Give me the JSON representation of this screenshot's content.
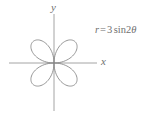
{
  "figure": {
    "caption_equation": "r = 3 sin 2θ",
    "axis_labels": {
      "x": "x",
      "y": "y"
    },
    "equation_parts": {
      "variable": "r",
      "equals": "=",
      "coefficient": "3",
      "function": "sin",
      "multiplier": "2",
      "angle": "θ"
    },
    "colors": {
      "curve": "#8a8a8a",
      "axis": "#9a9a9a",
      "text": "#6f6f6f",
      "background": "#ffffff"
    }
  },
  "chart_data": {
    "type": "line",
    "title": "",
    "subtitle": "",
    "xlabel": "x",
    "ylabel": "y",
    "annotations": [
      "r = 3 sin 2θ"
    ],
    "grid": false,
    "legend": "none",
    "coordinate_system": "polar",
    "curve_name": "four-petaled rose",
    "polar_equation": "r = 3 sin(2θ)",
    "amplitude": 3,
    "petal_count": 4,
    "petal_max_radius": 3,
    "petal_axis_angles_deg": [
      45,
      135,
      225,
      315
    ],
    "theta_range_deg": [
      0,
      360
    ],
    "xlim": [
      -3.2,
      3.2
    ],
    "ylim": [
      -3.2,
      3.2
    ],
    "origin": {
      "x": 0,
      "y": 0
    },
    "series": [
      {
        "name": "r = 3 sin 2θ",
        "theta_deg": [
          0,
          10,
          20,
          30,
          40,
          45,
          50,
          60,
          70,
          80,
          90,
          100,
          110,
          120,
          130,
          135,
          140,
          150,
          160,
          170,
          180,
          190,
          200,
          210,
          220,
          225,
          230,
          240,
          250,
          260,
          270,
          280,
          290,
          300,
          310,
          315,
          320,
          330,
          340,
          350,
          360
        ],
        "r": [
          0,
          1.03,
          1.93,
          2.6,
          2.95,
          3,
          2.95,
          2.6,
          1.93,
          1.03,
          0,
          -1.03,
          -1.93,
          -2.6,
          -2.95,
          -3,
          -2.95,
          -2.6,
          -1.93,
          -1.03,
          0,
          1.03,
          1.93,
          2.6,
          2.95,
          3,
          2.95,
          2.6,
          1.93,
          1.03,
          0,
          -1.03,
          -1.93,
          -2.6,
          -2.95,
          -3,
          -2.95,
          -2.6,
          -1.93,
          -1.03,
          0
        ]
      }
    ]
  }
}
